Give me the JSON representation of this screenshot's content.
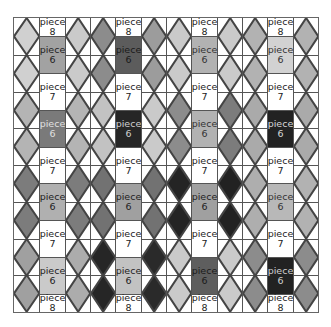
{
  "caption": "",
  "grid": {
    "columns": 12,
    "diamond_rows": 8,
    "line_color": "#555555",
    "diamond_columns": [
      {
        "index": 0,
        "fills": [
          "#d0d0d0",
          "#d0d0d0",
          "#b4b4b4",
          "#b4b4b4",
          "#7c7c7c",
          "#7c7c7c",
          "#a0a0a0",
          "#a0a0a0"
        ]
      },
      {
        "index": 2,
        "fills": [
          "#cacaca",
          "#cacaca",
          "#b4b4b4",
          "#b4b4b4",
          "#7c7c7c",
          "#7c7c7c",
          "#acacac",
          "#acacac"
        ]
      },
      {
        "index": 3,
        "fills": [
          "#8c8c8c",
          "#8c8c8c",
          "#c2c2c2",
          "#c2c2c2",
          "#727272",
          "#727272",
          "#262626",
          "#262626"
        ]
      },
      {
        "index": 5,
        "fills": [
          "#9c9c9c",
          "#9c9c9c",
          "#cacaca",
          "#cacaca",
          "#727272",
          "#727272",
          "#2a2a2a",
          "#2a2a2a"
        ]
      },
      {
        "index": 6,
        "fills": [
          "#cacaca",
          "#cacaca",
          "#8c8c8c",
          "#8c8c8c",
          "#242424",
          "#242424",
          "#cacaca",
          "#cacaca"
        ]
      },
      {
        "index": 8,
        "fills": [
          "#cacaca",
          "#cacaca",
          "#7c7c7c",
          "#7c7c7c",
          "#222222",
          "#222222",
          "#cacaca",
          "#cacaca"
        ]
      },
      {
        "index": 9,
        "fills": [
          "#b2b2b2",
          "#b2b2b2",
          "#aaaaaa",
          "#aaaaaa",
          "#aeaeae",
          "#aeaeae",
          "#8c8c8c",
          "#8c8c8c"
        ]
      },
      {
        "index": 11,
        "fills": [
          "#b2b2b2",
          "#b2b2b2",
          "#aaaaaa",
          "#aaaaaa",
          "#b2b2b2",
          "#b2b2b2",
          "#8c8c8c",
          "#8c8c8c"
        ]
      }
    ],
    "label_columns": [
      {
        "index": 1,
        "cells": [
          {
            "word": "piece",
            "num": "8",
            "bg": "#ffffff",
            "fg": "#222222",
            "size": "half"
          },
          {
            "word": "piece",
            "num": "6",
            "bg": "#a2a2a2",
            "fg": "#222222",
            "size": "full"
          },
          {
            "word": "piece",
            "num": "7",
            "bg": "#ffffff",
            "fg": "#222222",
            "size": "full"
          },
          {
            "word": "piece",
            "num": "6",
            "bg": "#7a7a7a",
            "fg": "#e0e0e0",
            "size": "full"
          },
          {
            "word": "piece",
            "num": "7",
            "bg": "#ffffff",
            "fg": "#222222",
            "size": "full"
          },
          {
            "word": "piece",
            "num": "6",
            "bg": "#b0b0b0",
            "fg": "#222222",
            "size": "full"
          },
          {
            "word": "piece",
            "num": "7",
            "bg": "#ffffff",
            "fg": "#222222",
            "size": "full"
          },
          {
            "word": "piece",
            "num": "6",
            "bg": "#cacaca",
            "fg": "#222222",
            "size": "full"
          },
          {
            "word": "piece",
            "num": "8",
            "bg": "#ffffff",
            "fg": "#222222",
            "size": "half"
          }
        ]
      },
      {
        "index": 4,
        "cells": [
          {
            "word": "piece",
            "num": "8",
            "bg": "#ffffff",
            "fg": "#222222",
            "size": "half"
          },
          {
            "word": "piece",
            "num": "6",
            "bg": "#5c5c5c",
            "fg": "#1a1a1a",
            "size": "full"
          },
          {
            "word": "piece",
            "num": "7",
            "bg": "#ffffff",
            "fg": "#222222",
            "size": "full"
          },
          {
            "word": "piece",
            "num": "6",
            "bg": "#262626",
            "fg": "#d0d0d0",
            "size": "full"
          },
          {
            "word": "piece",
            "num": "7",
            "bg": "#ffffff",
            "fg": "#222222",
            "size": "full"
          },
          {
            "word": "piece",
            "num": "6",
            "bg": "#a0a0a0",
            "fg": "#222222",
            "size": "full"
          },
          {
            "word": "piece",
            "num": "7",
            "bg": "#ffffff",
            "fg": "#222222",
            "size": "full"
          },
          {
            "word": "piece",
            "num": "6",
            "bg": "#c2c2c2",
            "fg": "#222222",
            "size": "full"
          },
          {
            "word": "piece",
            "num": "8",
            "bg": "#ffffff",
            "fg": "#222222",
            "size": "half"
          }
        ]
      },
      {
        "index": 7,
        "cells": [
          {
            "word": "piece",
            "num": "8",
            "bg": "#ffffff",
            "fg": "#222222",
            "size": "half"
          },
          {
            "word": "piece",
            "num": "6",
            "bg": "#b2b2b2",
            "fg": "#333333",
            "size": "full"
          },
          {
            "word": "piece",
            "num": "7",
            "bg": "#ffffff",
            "fg": "#222222",
            "size": "full"
          },
          {
            "word": "piece",
            "num": "6",
            "bg": "#b2b2b2",
            "fg": "#333333",
            "size": "full"
          },
          {
            "word": "piece",
            "num": "7",
            "bg": "#ffffff",
            "fg": "#222222",
            "size": "full"
          },
          {
            "word": "piece",
            "num": "6",
            "bg": "#a0a0a0",
            "fg": "#222222",
            "size": "full"
          },
          {
            "word": "piece",
            "num": "7",
            "bg": "#ffffff",
            "fg": "#222222",
            "size": "full"
          },
          {
            "word": "piece",
            "num": "6",
            "bg": "#5e5e5e",
            "fg": "#1a1a1a",
            "size": "full"
          },
          {
            "word": "piece",
            "num": "8",
            "bg": "#ffffff",
            "fg": "#222222",
            "size": "half"
          }
        ]
      },
      {
        "index": 10,
        "cells": [
          {
            "word": "piece",
            "num": "8",
            "bg": "#ffffff",
            "fg": "#222222",
            "size": "half"
          },
          {
            "word": "piece",
            "num": "6",
            "bg": "#d2d2d2",
            "fg": "#333333",
            "size": "full"
          },
          {
            "word": "piece",
            "num": "7",
            "bg": "#ffffff",
            "fg": "#222222",
            "size": "full"
          },
          {
            "word": "piece",
            "num": "6",
            "bg": "#222222",
            "fg": "#d8d8d8",
            "size": "full"
          },
          {
            "word": "piece",
            "num": "7",
            "bg": "#ffffff",
            "fg": "#222222",
            "size": "full"
          },
          {
            "word": "piece",
            "num": "6",
            "bg": "#b8b8b8",
            "fg": "#333333",
            "size": "full"
          },
          {
            "word": "piece",
            "num": "7",
            "bg": "#ffffff",
            "fg": "#222222",
            "size": "full"
          },
          {
            "word": "piece",
            "num": "6",
            "bg": "#222222",
            "fg": "#d0d0d0",
            "size": "full"
          },
          {
            "word": "piece",
            "num": "8",
            "bg": "#ffffff",
            "fg": "#222222",
            "size": "half"
          }
        ]
      }
    ]
  }
}
